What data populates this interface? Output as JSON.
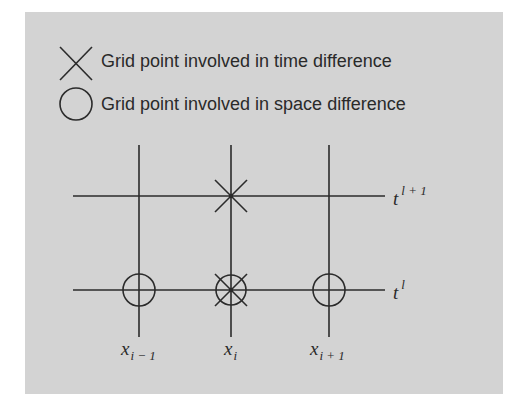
{
  "legend": {
    "items": [
      {
        "icon": "cross-marker-icon",
        "label": "Grid point involved in time difference"
      },
      {
        "icon": "circle-marker-icon",
        "label": "Grid point involved in space difference"
      }
    ]
  },
  "grid": {
    "time_levels": [
      {
        "base": "t",
        "superscript": "l + 1"
      },
      {
        "base": "t",
        "superscript": "l"
      }
    ],
    "space_nodes": [
      {
        "base": "x",
        "subscript": "i − 1"
      },
      {
        "base": "x",
        "subscript": "i"
      },
      {
        "base": "x",
        "subscript": "i + 1"
      }
    ],
    "markers": [
      {
        "node": "x_i",
        "time": "t^{l+1}",
        "type": "cross"
      },
      {
        "node": "x_{i-1}",
        "time": "t^l",
        "type": "circle"
      },
      {
        "node": "x_i",
        "time": "t^l",
        "type": "circle+cross"
      },
      {
        "node": "x_{i+1}",
        "time": "t^l",
        "type": "circle"
      }
    ]
  },
  "colors": {
    "panel_background": "#d3d3d3",
    "ink": "#2b2b2b"
  }
}
